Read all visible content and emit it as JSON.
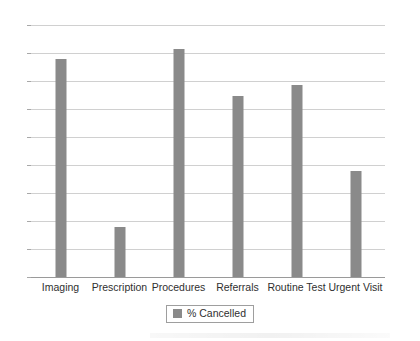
{
  "chart_data": {
    "type": "bar",
    "title": "",
    "xlabel": "",
    "ylabel": "",
    "categories": [
      "Imaging",
      "Prescription",
      "Procedures",
      "Referrals",
      "Routine Test",
      "Urgent Visit"
    ],
    "values": [
      78,
      18,
      81.5,
      64.5,
      68.5,
      38
    ],
    "series": [
      {
        "name": "% Cancelled",
        "values": [
          78,
          18,
          81.5,
          64.5,
          68.5,
          38
        ],
        "color": "#8a8a8a"
      }
    ],
    "ylim": [
      0,
      90
    ],
    "yticks": [
      0,
      10,
      20,
      30,
      40,
      50,
      60,
      70,
      80,
      90
    ],
    "ytick_labels": [
      "0",
      "10",
      "20",
      "30",
      "40",
      "50",
      "60",
      "70",
      "80",
      "90"
    ],
    "grid": true,
    "grid_axis": "y",
    "legend": {
      "position": "bottom-center",
      "entries": [
        {
          "label": "% Cancelled",
          "color": "#8a8a8a"
        }
      ]
    }
  },
  "legend": {
    "label": "% Cancelled"
  },
  "colors": {
    "bar": "#8a8a8a",
    "gridline": "#d0d0d0",
    "axis": "#9a9a9a",
    "text": "#2f2f2f",
    "background": "#ffffff"
  }
}
